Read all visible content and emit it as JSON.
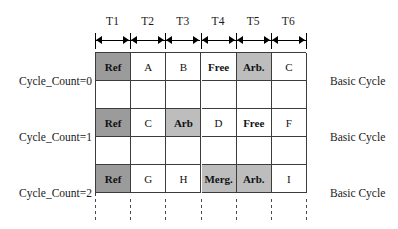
{
  "figure": {
    "columns": [
      "T1",
      "T2",
      "T3",
      "T4",
      "T5",
      "T6"
    ],
    "rows": [
      {
        "left_label": "Cycle_Count=0",
        "right_label": "Basic Cycle",
        "cells": [
          {
            "text": "Ref",
            "shade": "dark"
          },
          {
            "text": "A",
            "shade": "none"
          },
          {
            "text": "B",
            "shade": "none"
          },
          {
            "text": "Free",
            "shade": "none"
          },
          {
            "text": "Arb.",
            "shade": "mid"
          },
          {
            "text": "C",
            "shade": "none"
          }
        ]
      },
      {
        "left_label": "Cycle_Count=1",
        "right_label": "Basic Cycle",
        "cells": [
          {
            "text": "Ref",
            "shade": "dark"
          },
          {
            "text": "C",
            "shade": "none"
          },
          {
            "text": "Arb",
            "shade": "mid"
          },
          {
            "text": "D",
            "shade": "none"
          },
          {
            "text": "Free",
            "shade": "none"
          },
          {
            "text": "F",
            "shade": "none"
          }
        ]
      },
      {
        "left_label": "Cycle_Count=2",
        "right_label": "Basic Cycle",
        "cells": [
          {
            "text": "Ref",
            "shade": "dark"
          },
          {
            "text": "G",
            "shade": "none"
          },
          {
            "text": "H",
            "shade": "none"
          },
          {
            "text": "Merg.",
            "shade": "mid"
          },
          {
            "text": "Arb.",
            "shade": "mid"
          },
          {
            "text": "I",
            "shade": "none"
          }
        ]
      }
    ],
    "colors": {
      "shade_dark": "#9b9b9b",
      "shade_mid": "#bdbdbd",
      "cell_background": "#ffffff",
      "grid_line": "#3c3c3c",
      "text": "#121212"
    }
  }
}
